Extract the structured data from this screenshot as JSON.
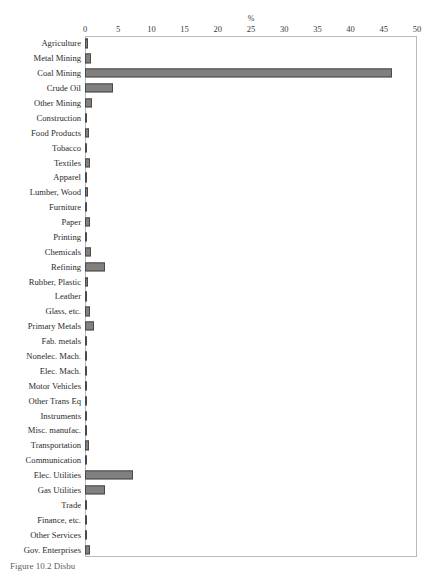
{
  "figure": {
    "caption": "Figure 10.2 Disbu"
  },
  "chart_data": {
    "type": "bar",
    "orientation": "horizontal",
    "title": "",
    "xlabel": "%",
    "ylabel": "",
    "xlim": [
      0,
      50
    ],
    "xticks": [
      0,
      5,
      10,
      15,
      20,
      25,
      30,
      35,
      40,
      45,
      50
    ],
    "xtick_labels": [
      "0",
      "5",
      "10",
      "15",
      "20",
      "25",
      "30",
      "35",
      "40",
      "45",
      "50"
    ],
    "grid": false,
    "legend": null,
    "bar_color": "#808080",
    "bar_edge_color": "#4a4a4a",
    "frame_color": "#b9b9b9",
    "categories": [
      "Agriculture",
      "Metal Mining",
      "Coal Mining",
      "Crude Oil",
      "Other Mining",
      "Construction",
      "Food Products",
      "Tobacco",
      "Textiles",
      "Apparel",
      "Lumber, Wood",
      "Furniture",
      "Paper",
      "Printing",
      "Chemicals",
      "Refining",
      "Rubber, Plastic",
      "Leather",
      "Glass, etc.",
      "Primary Metals",
      "Fab. metals",
      "Nonelec. Mach.",
      "Elec. Mach.",
      "Motor Vehicles",
      "Other Trans Eq",
      "Instruments",
      "Misc. manufac.",
      "Transportation",
      "Communication",
      "Elec. Utilities",
      "Gas Utilities",
      "Trade",
      "Finance, etc.",
      "Other Services",
      "Gov. Enterprises"
    ],
    "values": [
      0.5,
      0.9,
      46.3,
      4.2,
      1.0,
      0.3,
      0.6,
      0.2,
      0.8,
      0.2,
      0.5,
      0.2,
      0.7,
      0.3,
      0.9,
      3.0,
      0.5,
      0.15,
      0.8,
      1.3,
      0.3,
      0.25,
      0.25,
      0.2,
      0.2,
      0.25,
      0.3,
      0.6,
      0.2,
      7.2,
      3.0,
      0.3,
      0.2,
      0.25,
      0.7
    ]
  }
}
